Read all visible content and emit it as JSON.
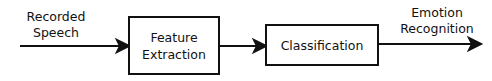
{
  "diagram": {
    "input_label": [
      "Recorded",
      "Speech"
    ],
    "blocks": [
      {
        "label": [
          "Feature",
          "Extraction"
        ]
      },
      {
        "label": [
          "Classification"
        ]
      }
    ],
    "output_label": [
      "Emotion",
      "Recognition"
    ],
    "colors": {
      "line": "#111111",
      "background": "#ffffff"
    }
  }
}
